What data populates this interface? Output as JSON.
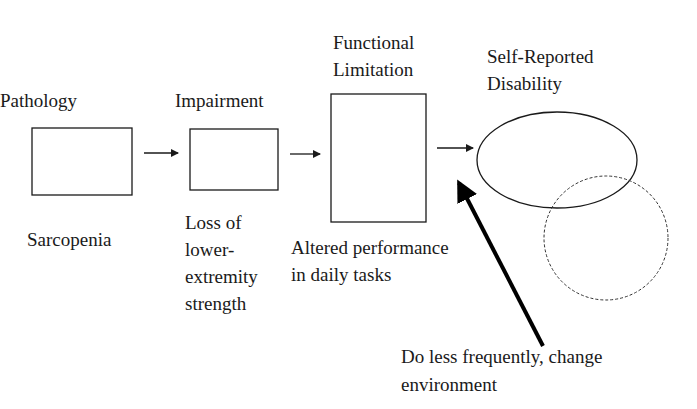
{
  "diagram": {
    "stages": [
      {
        "title": "Pathology",
        "example_lines": [
          "Sarcopenia"
        ]
      },
      {
        "title": "Impairment",
        "example_lines": [
          "Loss of",
          "lower-",
          "extremity",
          "strength"
        ]
      },
      {
        "title_lines": [
          "Functional",
          "Limitation"
        ],
        "example_lines": [
          "Altered performance",
          "in daily tasks"
        ]
      },
      {
        "title_lines": [
          "Self-Reported",
          "Disability"
        ]
      }
    ],
    "intervention_lines": [
      "Do less frequently, change",
      "environment"
    ],
    "colors": {
      "stroke": "#1a1a1a",
      "background": "#ffffff"
    }
  }
}
